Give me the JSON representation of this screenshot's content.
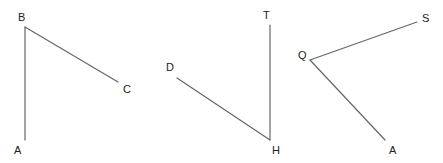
{
  "canvas": {
    "width": 443,
    "height": 163,
    "background_color": "#ffffff",
    "line_color": "#666666",
    "label_color": "#222222"
  },
  "figures": [
    {
      "name": "angle-abc",
      "vertex": "B",
      "rays": [
        {
          "from": "B",
          "to": "A"
        },
        {
          "from": "B",
          "to": "C"
        }
      ],
      "points": [
        {
          "label": "B",
          "x": 25,
          "y": 27,
          "label_x": 18,
          "label_y": 12
        },
        {
          "label": "A",
          "x": 25,
          "y": 140,
          "label_x": 14,
          "label_y": 145
        },
        {
          "label": "C",
          "x": 118,
          "y": 82,
          "label_x": 123,
          "label_y": 84
        }
      ],
      "segments": [
        {
          "x1": 25,
          "y1": 27,
          "x2": 25,
          "y2": 140
        },
        {
          "x1": 25,
          "y1": 27,
          "x2": 118,
          "y2": 82
        }
      ]
    },
    {
      "name": "angle-dht",
      "vertex": "H",
      "rays": [
        {
          "from": "H",
          "to": "D"
        },
        {
          "from": "H",
          "to": "T"
        }
      ],
      "points": [
        {
          "label": "D",
          "x": 177,
          "y": 78,
          "label_x": 166,
          "label_y": 62
        },
        {
          "label": "T",
          "x": 270,
          "y": 25,
          "label_x": 263,
          "label_y": 10
        },
        {
          "label": "H",
          "x": 270,
          "y": 140,
          "label_x": 272,
          "label_y": 145
        }
      ],
      "segments": [
        {
          "x1": 177,
          "y1": 78,
          "x2": 270,
          "y2": 140
        },
        {
          "x1": 270,
          "y1": 25,
          "x2": 270,
          "y2": 140
        }
      ]
    },
    {
      "name": "angle-sqa",
      "vertex": "Q",
      "rays": [
        {
          "from": "Q",
          "to": "S"
        },
        {
          "from": "Q",
          "to": "A"
        }
      ],
      "points": [
        {
          "label": "Q",
          "x": 310,
          "y": 60,
          "label_x": 298,
          "label_y": 50
        },
        {
          "label": "S",
          "x": 417,
          "y": 22,
          "label_x": 422,
          "label_y": 13
        },
        {
          "label": "A",
          "x": 385,
          "y": 140,
          "label_x": 389,
          "label_y": 145
        }
      ],
      "segments": [
        {
          "x1": 310,
          "y1": 60,
          "x2": 417,
          "y2": 22
        },
        {
          "x1": 310,
          "y1": 60,
          "x2": 385,
          "y2": 140
        }
      ]
    }
  ],
  "labels": {
    "b": "B",
    "a1": "A",
    "c": "C",
    "d": "D",
    "t": "T",
    "h": "H",
    "q": "Q",
    "s": "S",
    "a2": "A"
  }
}
